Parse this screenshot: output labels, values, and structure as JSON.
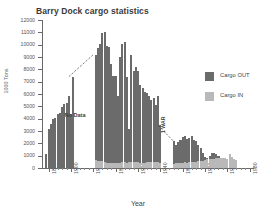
{
  "chart_data": {
    "type": "bar",
    "title": "Barry Dock cargo statistics",
    "xlabel": "Year",
    "ylabel": "1000 Tons",
    "ylim": [
      0,
      12000
    ],
    "ytick_step": 1000,
    "yticks": [
      0,
      1000,
      2000,
      3000,
      4000,
      5000,
      6000,
      7000,
      8000,
      9000,
      10000,
      11000,
      12000
    ],
    "ytick_labels": [
      "0",
      "1000",
      "2000",
      "3000",
      "4000",
      "5000",
      "6000",
      "7000",
      "8000",
      "9000",
      "10000",
      "11000",
      "12000"
    ],
    "xlim": [
      1887,
      1981
    ],
    "xticks": [
      1890,
      1900,
      1910,
      1920,
      1930,
      1940,
      1950,
      1960,
      1970,
      1980
    ],
    "xtick_labels": [
      "1890",
      "1900",
      "1910",
      "1920",
      "1930",
      "1940",
      "1950",
      "1960",
      "1970",
      "1980"
    ],
    "grid": false,
    "legend_position": "right",
    "colors": {
      "cargo_out": "#6b6b6b",
      "cargo_in": "#b9b9b9",
      "axis": "#6a6a6a",
      "text": "#4a4a4a",
      "background": "#ffffff"
    },
    "legend": [
      {
        "name": "Cargo OUT",
        "color": "#6b6b6b"
      },
      {
        "name": "Cargo IN",
        "color": "#b9b9b9"
      }
    ],
    "annotations": [
      {
        "name": "no-data",
        "text": "No Data",
        "x": 1904,
        "y": 3200
      },
      {
        "name": "war-label",
        "text": "1 WAR",
        "x": 1941,
        "y": 1400
      },
      {
        "name": "connector-1",
        "type": "dashed-line",
        "from": [
          1899,
          7400
        ],
        "to": [
          1910,
          9200
        ]
      },
      {
        "name": "connector-2",
        "type": "dashed-line",
        "from": [
          1939,
          3450
        ],
        "to": [
          1946,
          2150
        ]
      }
    ],
    "series": [
      {
        "name": "Cargo OUT",
        "color": "#6b6b6b",
        "points": [
          {
            "x": 1889,
            "y": 1100
          },
          {
            "x": 1890,
            "y": 3200
          },
          {
            "x": 1891,
            "y": 3550
          },
          {
            "x": 1892,
            "y": 3950
          },
          {
            "x": 1893,
            "y": 4050
          },
          {
            "x": 1894,
            "y": 4400
          },
          {
            "x": 1895,
            "y": 4450
          },
          {
            "x": 1896,
            "y": 4950
          },
          {
            "x": 1897,
            "y": 5200
          },
          {
            "x": 1898,
            "y": 5300
          },
          {
            "x": 1899,
            "y": 5850
          },
          {
            "x": 1900,
            "y": 4400
          },
          {
            "x": 1901,
            "y": 7400
          },
          {
            "x": 1911,
            "y": 9200
          },
          {
            "x": 1912,
            "y": 9750
          },
          {
            "x": 1913,
            "y": 10050
          },
          {
            "x": 1914,
            "y": 10950
          },
          {
            "x": 1915,
            "y": 11050
          },
          {
            "x": 1916,
            "y": 9900
          },
          {
            "x": 1917,
            "y": 9850
          },
          {
            "x": 1918,
            "y": 8400
          },
          {
            "x": 1919,
            "y": 7450
          },
          {
            "x": 1920,
            "y": 7500
          },
          {
            "x": 1921,
            "y": 5800
          },
          {
            "x": 1922,
            "y": 9000
          },
          {
            "x": 1923,
            "y": 10050
          },
          {
            "x": 1924,
            "y": 10250
          },
          {
            "x": 1925,
            "y": 7350
          },
          {
            "x": 1926,
            "y": 3200
          },
          {
            "x": 1927,
            "y": 9150
          },
          {
            "x": 1928,
            "y": 7900
          },
          {
            "x": 1929,
            "y": 8150
          },
          {
            "x": 1930,
            "y": 7850
          },
          {
            "x": 1931,
            "y": 6700
          },
          {
            "x": 1932,
            "y": 6450
          },
          {
            "x": 1933,
            "y": 6200
          },
          {
            "x": 1934,
            "y": 6050
          },
          {
            "x": 1935,
            "y": 5800
          },
          {
            "x": 1936,
            "y": 5550
          },
          {
            "x": 1937,
            "y": 5650
          },
          {
            "x": 1938,
            "y": 5100
          },
          {
            "x": 1939,
            "y": 5800
          },
          {
            "x": 1940,
            "y": 3450
          },
          {
            "x": 1946,
            "y": 2150
          },
          {
            "x": 1947,
            "y": 1900
          },
          {
            "x": 1948,
            "y": 2100
          },
          {
            "x": 1949,
            "y": 2300
          },
          {
            "x": 1950,
            "y": 2500
          },
          {
            "x": 1951,
            "y": 2600
          },
          {
            "x": 1952,
            "y": 2350
          },
          {
            "x": 1953,
            "y": 2400
          },
          {
            "x": 1954,
            "y": 2600
          },
          {
            "x": 1955,
            "y": 2300
          },
          {
            "x": 1956,
            "y": 2150
          },
          {
            "x": 1957,
            "y": 1900
          },
          {
            "x": 1958,
            "y": 1600
          },
          {
            "x": 1959,
            "y": 1250
          },
          {
            "x": 1960,
            "y": 900
          },
          {
            "x": 1961,
            "y": 850
          },
          {
            "x": 1962,
            "y": 950
          },
          {
            "x": 1963,
            "y": 1200
          },
          {
            "x": 1964,
            "y": 1200
          },
          {
            "x": 1965,
            "y": 1100
          },
          {
            "x": 1966,
            "y": 950
          },
          {
            "x": 1967,
            "y": 850
          },
          {
            "x": 1968,
            "y": 800
          },
          {
            "x": 1969,
            "y": 750
          },
          {
            "x": 1970,
            "y": 750
          },
          {
            "x": 1971,
            "y": 1150
          },
          {
            "x": 1972,
            "y": 700
          },
          {
            "x": 1973,
            "y": 650
          },
          {
            "x": 1974,
            "y": 650
          }
        ]
      },
      {
        "name": "Cargo IN",
        "color": "#b9b9b9",
        "points": [
          {
            "x": 1911,
            "y": 620
          },
          {
            "x": 1912,
            "y": 600
          },
          {
            "x": 1913,
            "y": 560
          },
          {
            "x": 1914,
            "y": 540
          },
          {
            "x": 1915,
            "y": 480
          },
          {
            "x": 1916,
            "y": 430
          },
          {
            "x": 1917,
            "y": 400
          },
          {
            "x": 1918,
            "y": 380
          },
          {
            "x": 1919,
            "y": 400
          },
          {
            "x": 1920,
            "y": 430
          },
          {
            "x": 1921,
            "y": 390
          },
          {
            "x": 1922,
            "y": 420
          },
          {
            "x": 1923,
            "y": 450
          },
          {
            "x": 1924,
            "y": 470
          },
          {
            "x": 1925,
            "y": 430
          },
          {
            "x": 1926,
            "y": 520
          },
          {
            "x": 1927,
            "y": 480
          },
          {
            "x": 1928,
            "y": 450
          },
          {
            "x": 1929,
            "y": 470
          },
          {
            "x": 1930,
            "y": 450
          },
          {
            "x": 1931,
            "y": 420
          },
          {
            "x": 1932,
            "y": 400
          },
          {
            "x": 1933,
            "y": 420
          },
          {
            "x": 1934,
            "y": 450
          },
          {
            "x": 1935,
            "y": 470
          },
          {
            "x": 1936,
            "y": 490
          },
          {
            "x": 1937,
            "y": 510
          },
          {
            "x": 1938,
            "y": 480
          },
          {
            "x": 1939,
            "y": 500
          },
          {
            "x": 1940,
            "y": 430
          },
          {
            "x": 1946,
            "y": 350
          },
          {
            "x": 1947,
            "y": 380
          },
          {
            "x": 1948,
            "y": 400
          },
          {
            "x": 1949,
            "y": 420
          },
          {
            "x": 1950,
            "y": 430
          },
          {
            "x": 1951,
            "y": 450
          },
          {
            "x": 1952,
            "y": 440
          },
          {
            "x": 1953,
            "y": 460
          },
          {
            "x": 1954,
            "y": 480
          },
          {
            "x": 1955,
            "y": 500
          },
          {
            "x": 1956,
            "y": 520
          },
          {
            "x": 1957,
            "y": 540
          },
          {
            "x": 1958,
            "y": 560
          },
          {
            "x": 1959,
            "y": 600
          },
          {
            "x": 1960,
            "y": 650
          },
          {
            "x": 1961,
            "y": 700
          },
          {
            "x": 1962,
            "y": 720
          },
          {
            "x": 1963,
            "y": 700
          },
          {
            "x": 1964,
            "y": 750
          },
          {
            "x": 1965,
            "y": 780
          },
          {
            "x": 1966,
            "y": 800
          },
          {
            "x": 1967,
            "y": 820
          },
          {
            "x": 1968,
            "y": 800
          },
          {
            "x": 1969,
            "y": 780
          },
          {
            "x": 1970,
            "y": 760
          },
          {
            "x": 1971,
            "y": 1150
          },
          {
            "x": 1972,
            "y": 900
          },
          {
            "x": 1973,
            "y": 700
          },
          {
            "x": 1974,
            "y": 650
          }
        ]
      }
    ]
  }
}
